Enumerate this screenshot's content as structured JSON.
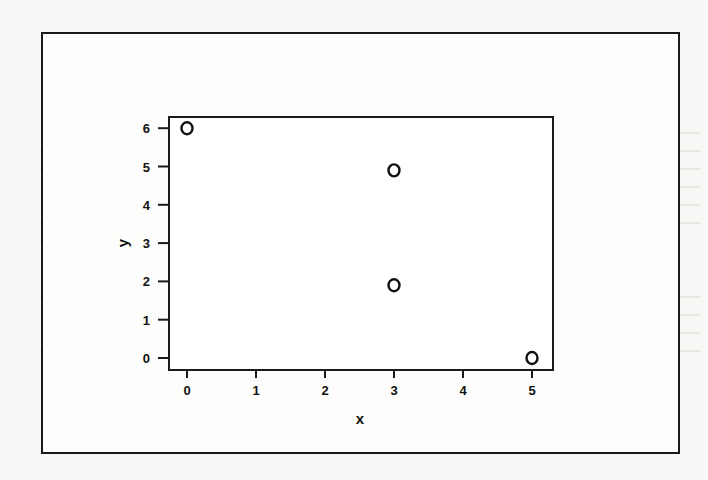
{
  "figure": {
    "frame_color": "#1a1a1a",
    "background": "#f7f7f5",
    "point_symbol": "open-circle"
  },
  "chart_data": {
    "type": "scatter",
    "title": "",
    "xlabel": "x",
    "ylabel": "y",
    "xlim": [
      -0.25,
      5.25
    ],
    "ylim": [
      -0.3,
      6.3
    ],
    "x_ticks": [
      0,
      1,
      2,
      3,
      4,
      5
    ],
    "y_ticks": [
      0,
      1,
      2,
      3,
      4,
      5,
      6
    ],
    "grid": false,
    "legend": null,
    "series": [
      {
        "name": "points",
        "marker": "o",
        "points": [
          {
            "x": 0,
            "y": 6
          },
          {
            "x": 3,
            "y": 4.9
          },
          {
            "x": 3,
            "y": 1.9
          },
          {
            "x": 5,
            "y": 0
          }
        ]
      }
    ]
  }
}
